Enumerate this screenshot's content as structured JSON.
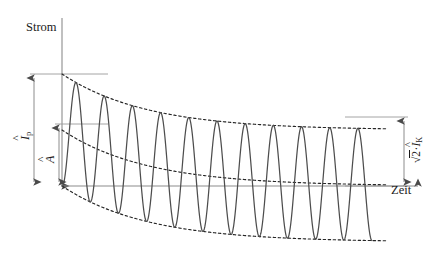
{
  "figure": {
    "kind": "short-circuit-current-waveform",
    "axes": {
      "y_label": "Strom",
      "x_label": "Zeit"
    },
    "annotations": {
      "peak_current": {
        "symbol_base": "I",
        "symbol_accent": "^",
        "subscript": "p",
        "plain": "Î_p"
      },
      "ac_amplitude": {
        "symbol_base": "A",
        "symbol_accent": "^",
        "subscript": "",
        "plain": "Â"
      },
      "steady_state": {
        "radical": "√",
        "radicand": "2",
        "dot": "·",
        "symbol_base": "I",
        "symbol_accent": "^",
        "subscript": "K",
        "plain": "√2·I_K"
      }
    },
    "colors": {
      "axis": "#808080",
      "waveform": "#4d4d4d",
      "envelope": "#262626",
      "dimension": "#7a7a7a",
      "text": "#1a1a1a",
      "background": "#ffffff"
    }
  },
  "chart_data": {
    "type": "line",
    "title": "",
    "xlabel": "Zeit",
    "ylabel": "Strom",
    "grid": false,
    "legend": false,
    "xlim": [
      0,
      11
    ],
    "ylim": [
      -1.9,
      1.9
    ],
    "geometry_px": {
      "origin_x": 62,
      "baseline_y": 186,
      "axis_top_y": 14,
      "axis_right_x": 424,
      "peak_level_y": 74,
      "ac_top_level_y": 124,
      "steady_upper_y": 117,
      "steady_lower_y": 232,
      "wave_start_x": 62,
      "wave_end_x": 372,
      "cycles": 11
    },
    "model": {
      "description": "Asymmetrischer Kurzschlussstrom: abklingendes Gleichstromglied plus konstanter Wechselstromanteil",
      "ac_amplitude_rel": 0.62,
      "dc_initial_rel": 0.62,
      "dc_decay_tau_cycles": 3.0,
      "cycles": 11,
      "peak_value_rel": 1.18,
      "steady_amplitude_rel": 0.62
    },
    "series": [
      {
        "name": "Kurzschlussstrom i(t)",
        "style": "solid",
        "color": "#4d4d4d"
      },
      {
        "name": "obere Hüllkurve",
        "style": "dashed",
        "color": "#262626"
      },
      {
        "name": "Gleichstromglied (Mittelwert)",
        "style": "dashed",
        "color": "#262626"
      },
      {
        "name": "untere Hüllkurve",
        "style": "dashed",
        "color": "#262626"
      }
    ],
    "reference_lines": [
      {
        "name": "Spitzenwert-Linie",
        "y_px": 74,
        "label": "Î_p"
      },
      {
        "name": "Wechselanteil-Linie",
        "y_px": 124,
        "label": "Â"
      },
      {
        "name": "stationäre-Obergrenze",
        "y_px": 117,
        "label": "√2·I_K"
      },
      {
        "name": "Nulllinie",
        "y_px": 186,
        "label": ""
      }
    ]
  }
}
